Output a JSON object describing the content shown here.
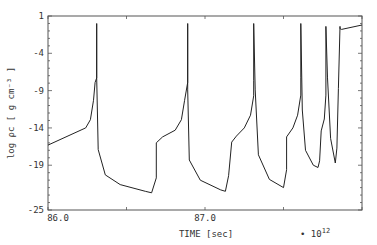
{
  "chart_data": {
    "type": "line",
    "title": "",
    "xlabel": "TIME [sec]",
    "x_multiplier": "• 10^12",
    "ylabel": "log ρc [ g cm⁻³ ]",
    "xlim": [
      86.0,
      88.0
    ],
    "ylim": [
      -25,
      1
    ],
    "x_tick_labels": [
      "86.0",
      "87.0"
    ],
    "x_major_ticks": [
      86.0,
      86.5,
      87.0,
      87.5,
      88.0
    ],
    "y_tick_labels": [
      "1",
      "-4",
      "-9",
      "-14",
      "-19",
      "-25"
    ],
    "y_ticks": [
      1,
      -4,
      -9,
      -14,
      -19,
      -25
    ],
    "grid": false,
    "legend": null,
    "series": [
      {
        "name": "central density",
        "points": [
          [
            86.0,
            -16.3
          ],
          [
            86.24,
            -14.0
          ],
          [
            86.27,
            -12.9
          ],
          [
            86.29,
            -10.3
          ],
          [
            86.3,
            -7.9
          ],
          [
            86.31,
            -7.3
          ],
          [
            86.31,
            0.0
          ],
          [
            86.31,
            -7.3
          ],
          [
            86.32,
            -16.9
          ],
          [
            86.365,
            -20.3
          ],
          [
            86.46,
            -21.6
          ],
          [
            86.62,
            -22.5
          ],
          [
            86.66,
            -22.7
          ],
          [
            86.69,
            -20.7
          ],
          [
            86.69,
            -16.0
          ],
          [
            86.73,
            -15.2
          ],
          [
            86.81,
            -14.3
          ],
          [
            86.85,
            -12.9
          ],
          [
            86.87,
            -10.3
          ],
          [
            86.89,
            -7.9
          ],
          [
            86.89,
            0.0
          ],
          [
            86.89,
            -8.9
          ],
          [
            86.9,
            -18.3
          ],
          [
            86.97,
            -21.0
          ],
          [
            87.1,
            -22.3
          ],
          [
            87.13,
            -22.5
          ],
          [
            87.15,
            -20.4
          ],
          [
            87.17,
            -15.9
          ],
          [
            87.2,
            -15.1
          ],
          [
            87.25,
            -14.0
          ],
          [
            87.29,
            -12.3
          ],
          [
            87.31,
            -9.7
          ],
          [
            87.31,
            -7.6
          ],
          [
            87.31,
            0.0
          ],
          [
            87.32,
            -8.9
          ],
          [
            87.34,
            -17.6
          ],
          [
            87.41,
            -20.9
          ],
          [
            87.5,
            -22.0
          ],
          [
            87.52,
            -19.6
          ],
          [
            87.52,
            -15.2
          ],
          [
            87.56,
            -14.0
          ],
          [
            87.59,
            -12.3
          ],
          [
            87.61,
            -9.6
          ],
          [
            87.61,
            -7.3
          ],
          [
            87.61,
            0.0
          ],
          [
            87.62,
            -11.6
          ],
          [
            87.64,
            -17.0
          ],
          [
            87.69,
            -19.0
          ],
          [
            87.72,
            -19.3
          ],
          [
            87.73,
            -18.4
          ],
          [
            87.74,
            -14.4
          ],
          [
            87.76,
            -12.8
          ],
          [
            87.77,
            -9.6
          ],
          [
            87.77,
            -0.4
          ],
          [
            87.78,
            -7.3
          ],
          [
            87.8,
            -15.4
          ],
          [
            87.83,
            -18.7
          ],
          [
            87.84,
            -16.7
          ],
          [
            87.85,
            -8.7
          ],
          [
            87.86,
            -0.4
          ],
          [
            87.86,
            -0.7
          ],
          [
            87.87,
            -0.8
          ],
          [
            88.0,
            -0.2
          ]
        ]
      }
    ]
  }
}
